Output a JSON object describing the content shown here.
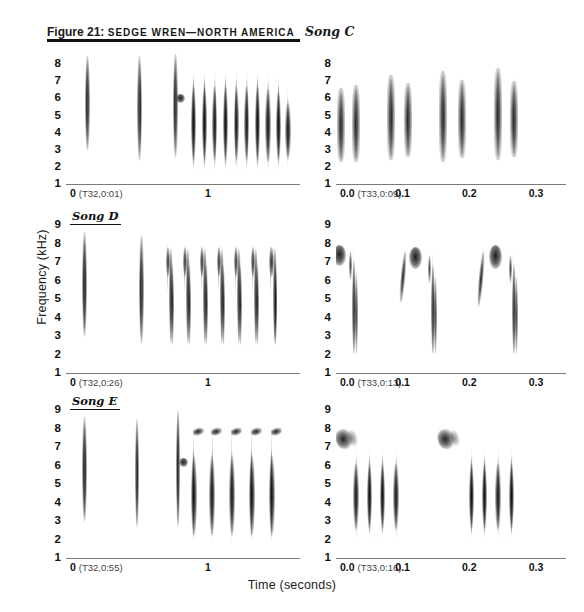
{
  "figure": {
    "number": "Figure 21:",
    "caption": "SEDGE WREN—NORTH AMERICA",
    "song_tag": "Song C",
    "y_axis_title": "Frequency (kHz)",
    "x_axis_title": "Time (seconds)"
  },
  "chart_data": {
    "type": "spectrogram",
    "xlabel": "Time (seconds)",
    "ylabel": "Frequency (kHz)",
    "grid": true,
    "legend": "none",
    "panels": [
      {
        "id": "song-c-left",
        "song": "Song C",
        "recording_ref": "(T32,0:01)",
        "xlim": [
          0,
          1.65
        ],
        "ylim": [
          1,
          8.6
        ],
        "yticks": [
          8,
          7,
          6,
          5,
          4,
          3,
          2,
          1
        ],
        "xticks": [
          0,
          0.5,
          1,
          1.5
        ],
        "xticklabels": [
          "0",
          "",
          "1",
          ""
        ],
        "description": "Three isolated introductory notes followed by a trill of ten elements",
        "elements": [
          {
            "t": 0.15,
            "f_low": 3.0,
            "f_high": 8.5,
            "kind": "intro-note"
          },
          {
            "t": 0.52,
            "f_low": 2.4,
            "f_high": 8.5,
            "kind": "intro-note"
          },
          {
            "t": 0.77,
            "f_low": 2.6,
            "f_high": 8.6,
            "kind": "intro-note-with-blob",
            "blob_f": 6.0
          },
          {
            "t": 0.9,
            "f_low": 1.9,
            "f_high": 7.4,
            "kind": "trill"
          },
          {
            "t": 0.975,
            "f_low": 1.9,
            "f_high": 7.4,
            "kind": "trill"
          },
          {
            "t": 1.05,
            "f_low": 1.9,
            "f_high": 7.4,
            "kind": "trill"
          },
          {
            "t": 1.125,
            "f_low": 1.9,
            "f_high": 7.4,
            "kind": "trill"
          },
          {
            "t": 1.2,
            "f_low": 1.9,
            "f_high": 7.4,
            "kind": "trill"
          },
          {
            "t": 1.275,
            "f_low": 1.9,
            "f_high": 7.4,
            "kind": "trill"
          },
          {
            "t": 1.35,
            "f_low": 1.9,
            "f_high": 7.4,
            "kind": "trill"
          },
          {
            "t": 1.425,
            "f_low": 1.9,
            "f_high": 7.2,
            "kind": "trill"
          },
          {
            "t": 1.5,
            "f_low": 2.0,
            "f_high": 7.0,
            "kind": "trill"
          },
          {
            "t": 1.565,
            "f_low": 2.2,
            "f_high": 6.2,
            "kind": "trill"
          }
        ]
      },
      {
        "id": "song-c-right",
        "song": "Song C",
        "recording_ref": "(T33,0:09)",
        "xlim": [
          0,
          0.345
        ],
        "ylim": [
          1,
          8.6
        ],
        "yticks": [
          8,
          7,
          6,
          5,
          4,
          3,
          2,
          1
        ],
        "xticks": [
          0.0,
          0.05,
          0.1,
          0.15,
          0.2,
          0.25,
          0.3
        ],
        "xticklabels": [
          "0.0",
          "",
          "0.1",
          "",
          "0.2",
          "",
          "0.3"
        ],
        "description": "Expanded view: four repeated couplets of broadband buzzy notes",
        "elements": [
          {
            "t": 0.008,
            "f_low": 2.3,
            "f_high": 6.6,
            "kind": "buzz"
          },
          {
            "t": 0.03,
            "f_low": 2.3,
            "f_high": 6.8,
            "kind": "buzz"
          },
          {
            "t": 0.082,
            "f_low": 2.4,
            "f_high": 7.4,
            "kind": "buzz"
          },
          {
            "t": 0.108,
            "f_low": 2.6,
            "f_high": 6.9,
            "kind": "buzz"
          },
          {
            "t": 0.16,
            "f_low": 2.3,
            "f_high": 7.6,
            "kind": "buzz"
          },
          {
            "t": 0.189,
            "f_low": 2.5,
            "f_high": 7.1,
            "kind": "buzz"
          },
          {
            "t": 0.243,
            "f_low": 2.4,
            "f_high": 7.8,
            "kind": "buzz"
          },
          {
            "t": 0.267,
            "f_low": 2.6,
            "f_high": 7.0,
            "kind": "buzz"
          }
        ]
      },
      {
        "id": "song-d-left",
        "song": "Song D",
        "recording_ref": "(T32,0:26)",
        "xlim": [
          0,
          1.65
        ],
        "ylim": [
          1,
          9
        ],
        "yticks": [
          9,
          8,
          7,
          6,
          5,
          4,
          3,
          2,
          1
        ],
        "xticks": [
          0,
          0.5,
          1,
          1.5
        ],
        "xticklabels": [
          "0",
          "",
          "1",
          ""
        ],
        "description": "Two introductory notes followed by seven down-sweeping hook elements",
        "elements": [
          {
            "t": 0.13,
            "f_low": 3.0,
            "f_high": 8.6,
            "kind": "intro-note"
          },
          {
            "t": 0.53,
            "f_low": 2.6,
            "f_high": 8.4,
            "kind": "intro-note"
          },
          {
            "t": 0.72,
            "f_low": 2.5,
            "f_high": 7.8,
            "kind": "hook"
          },
          {
            "t": 0.84,
            "f_low": 2.5,
            "f_high": 7.8,
            "kind": "hook"
          },
          {
            "t": 0.96,
            "f_low": 2.5,
            "f_high": 7.8,
            "kind": "hook"
          },
          {
            "t": 1.08,
            "f_low": 2.5,
            "f_high": 7.8,
            "kind": "hook"
          },
          {
            "t": 1.2,
            "f_low": 2.5,
            "f_high": 7.8,
            "kind": "hook"
          },
          {
            "t": 1.32,
            "f_low": 2.5,
            "f_high": 7.8,
            "kind": "hook"
          },
          {
            "t": 1.45,
            "f_low": 2.5,
            "f_high": 7.8,
            "kind": "hook"
          }
        ]
      },
      {
        "id": "song-d-right",
        "song": "Song D",
        "recording_ref": "(T33,0:13)",
        "xlim": [
          0,
          0.345
        ],
        "ylim": [
          1,
          9
        ],
        "yticks": [
          9,
          8,
          7,
          6,
          5,
          4,
          3,
          2,
          1
        ],
        "xticks": [
          0.0,
          0.05,
          0.1,
          0.15,
          0.2,
          0.25,
          0.3
        ],
        "xticklabels": [
          "0.0",
          "",
          "0.1",
          "",
          "0.2",
          "",
          "0.3"
        ],
        "description": "Expanded view: three repetitions of a high blob followed by a long descending smear",
        "elements": [
          {
            "t": 0.004,
            "f_low": 6.8,
            "f_high": 7.9,
            "kind": "blob"
          },
          {
            "t": 0.022,
            "f_low": 2.0,
            "f_high": 7.6,
            "kind": "sweep"
          },
          {
            "t": 0.1,
            "f_low": 4.8,
            "f_high": 7.6,
            "kind": "riser"
          },
          {
            "t": 0.118,
            "f_low": 6.6,
            "f_high": 7.8,
            "kind": "blob"
          },
          {
            "t": 0.14,
            "f_low": 2.0,
            "f_high": 7.4,
            "kind": "sweep"
          },
          {
            "t": 0.218,
            "f_low": 4.6,
            "f_high": 7.6,
            "kind": "riser"
          },
          {
            "t": 0.238,
            "f_low": 6.6,
            "f_high": 7.9,
            "kind": "blob"
          },
          {
            "t": 0.262,
            "f_low": 2.0,
            "f_high": 7.4,
            "kind": "sweep"
          }
        ]
      },
      {
        "id": "song-e-left",
        "song": "Song E",
        "recording_ref": "(T32,0:55)",
        "xlim": [
          0,
          1.65
        ],
        "ylim": [
          1,
          9
        ],
        "yticks": [
          9,
          8,
          7,
          6,
          5,
          4,
          3,
          2,
          1
        ],
        "xticks": [
          0,
          0.5,
          1,
          1.5
        ],
        "xticklabels": [
          "0",
          "",
          "1",
          ""
        ],
        "description": "Three introductory notes then five trill elements each capped by a high slanted dash near 7.5 kHz",
        "elements": [
          {
            "t": 0.13,
            "f_low": 3.0,
            "f_high": 8.6,
            "kind": "intro-note"
          },
          {
            "t": 0.5,
            "f_low": 2.7,
            "f_high": 8.5,
            "kind": "intro-note"
          },
          {
            "t": 0.79,
            "f_low": 2.7,
            "f_high": 9.0,
            "kind": "intro-note-with-blob",
            "blob_f": 6.2
          },
          {
            "t": 0.9,
            "f_low": 1.9,
            "f_high": 7.8,
            "kind": "trill-with-dash"
          },
          {
            "t": 1.03,
            "f_low": 1.9,
            "f_high": 7.8,
            "kind": "trill-with-dash"
          },
          {
            "t": 1.17,
            "f_low": 1.9,
            "f_high": 7.8,
            "kind": "trill-with-dash"
          },
          {
            "t": 1.31,
            "f_low": 1.9,
            "f_high": 7.8,
            "kind": "trill-with-dash"
          },
          {
            "t": 1.45,
            "f_low": 1.9,
            "f_high": 7.8,
            "kind": "trill-with-dash"
          }
        ]
      },
      {
        "id": "song-e-right",
        "song": "Song E",
        "recording_ref": "(T33,0:16)",
        "xlim": [
          0,
          0.345
        ],
        "ylim": [
          1,
          9
        ],
        "yticks": [
          9,
          8,
          7,
          6,
          5,
          4,
          3,
          2,
          1
        ],
        "xticks": [
          0.0,
          0.05,
          0.1,
          0.15,
          0.2,
          0.25,
          0.3
        ],
        "xticklabels": [
          "0.0",
          "",
          "0.1",
          "",
          "0.2",
          "",
          "0.3"
        ],
        "description": "Expanded view: two repetitions of a high dark dash near 7.5 kHz followed by four trill elements",
        "elements": [
          {
            "t": 0.004,
            "f_low": 6.9,
            "f_high": 8.0,
            "kind": "dash"
          },
          {
            "t": 0.03,
            "f_low": 2.2,
            "f_high": 6.6,
            "kind": "trill"
          },
          {
            "t": 0.05,
            "f_low": 2.2,
            "f_high": 6.6,
            "kind": "trill"
          },
          {
            "t": 0.07,
            "f_low": 2.2,
            "f_high": 6.6,
            "kind": "trill"
          },
          {
            "t": 0.09,
            "f_low": 2.2,
            "f_high": 6.6,
            "kind": "trill"
          },
          {
            "t": 0.158,
            "f_low": 6.9,
            "f_high": 8.0,
            "kind": "dash"
          },
          {
            "t": 0.203,
            "f_low": 2.2,
            "f_high": 6.6,
            "kind": "trill"
          },
          {
            "t": 0.223,
            "f_low": 2.2,
            "f_high": 6.6,
            "kind": "trill"
          },
          {
            "t": 0.243,
            "f_low": 2.2,
            "f_high": 6.6,
            "kind": "trill"
          },
          {
            "t": 0.263,
            "f_low": 2.2,
            "f_high": 6.6,
            "kind": "trill"
          }
        ]
      }
    ]
  },
  "colors": {
    "ink": "#111111",
    "grid": "#8d8d8d",
    "rule": "#1b1b1b",
    "background": "#ffffff"
  }
}
